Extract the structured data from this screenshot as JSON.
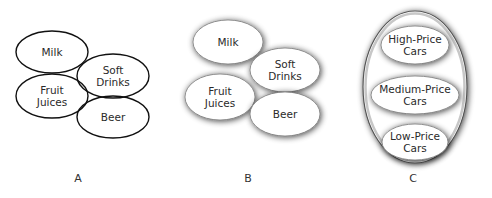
{
  "panels": [
    {
      "caption": "A",
      "style": "outlined",
      "items": [
        {
          "lines": [
            "Milk"
          ],
          "cx": 52,
          "cy": 52,
          "rx": 36,
          "ry": 21
        },
        {
          "lines": [
            "Soft",
            "Drinks"
          ],
          "cx": 113,
          "cy": 76,
          "rx": 36,
          "ry": 22
        },
        {
          "lines": [
            "Fruit",
            "Juices"
          ],
          "cx": 52,
          "cy": 96,
          "rx": 36,
          "ry": 22
        },
        {
          "lines": [
            "Beer"
          ],
          "cx": 113,
          "cy": 117,
          "rx": 36,
          "ry": 21
        }
      ]
    },
    {
      "caption": "B",
      "style": "shadowed",
      "items": [
        {
          "lines": [
            "Milk"
          ],
          "cx": 228,
          "cy": 42,
          "rx": 35,
          "ry": 22
        },
        {
          "lines": [
            "Soft",
            "Drinks"
          ],
          "cx": 285,
          "cy": 70,
          "rx": 35,
          "ry": 22
        },
        {
          "lines": [
            "Fruit",
            "Juices"
          ],
          "cx": 220,
          "cy": 97,
          "rx": 35,
          "ry": 23
        },
        {
          "lines": [
            "Beer"
          ],
          "cx": 285,
          "cy": 114,
          "rx": 35,
          "ry": 22
        }
      ]
    },
    {
      "caption": "C",
      "style": "nested",
      "outer": {
        "cx": 415,
        "cy": 87,
        "rx": 52,
        "ry": 76
      },
      "items": [
        {
          "lines": [
            "High-Price",
            "Cars"
          ],
          "cx": 415,
          "cy": 45,
          "rx": 34,
          "ry": 19
        },
        {
          "lines": [
            "Medium-Price",
            "Cars"
          ],
          "cx": 415,
          "cy": 95,
          "rx": 44,
          "ry": 19
        },
        {
          "lines": [
            "Low-Price",
            "Cars"
          ],
          "cx": 415,
          "cy": 142,
          "rx": 33,
          "ry": 18
        }
      ]
    }
  ],
  "colors": {
    "stroke": "#111111",
    "fill": "#ffffff",
    "shadow": "#6e6e6e",
    "text": "#2a2a2a"
  }
}
